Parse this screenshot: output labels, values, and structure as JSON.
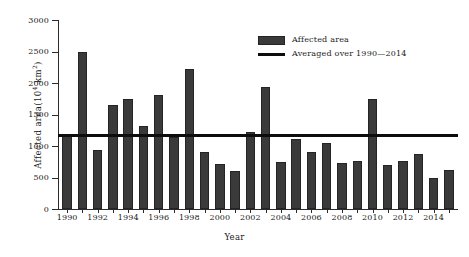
{
  "chart_data": {
    "type": "bar",
    "title": "",
    "xlabel": "Year",
    "ylabel": "Affected area(10⁴ km²)",
    "ylabel_base": "Affected  area(10",
    "ylabel_sup1": "4",
    "ylabel_mid": "  km",
    "ylabel_sup2": "2",
    "ylabel_end": ")",
    "xlim": [
      1989.4,
      2015.6
    ],
    "ylim": [
      0,
      3000
    ],
    "yticks": [
      0,
      500,
      1000,
      1500,
      2000,
      2500,
      3000
    ],
    "ytick_labels": [
      "0",
      "500",
      "1000",
      "1500",
      "2000",
      "2500",
      "3000"
    ],
    "xticks": [
      1990,
      1992,
      1994,
      1996,
      1998,
      2000,
      2002,
      2004,
      2006,
      2008,
      2010,
      2012,
      2014
    ],
    "xtick_labels": [
      "1990",
      "1992",
      "1994",
      "1996",
      "1998",
      "2000",
      "2002",
      "2004",
      "2006",
      "2008",
      "2010",
      "2012",
      "2014"
    ],
    "grid": false,
    "legend_position": "upper-right",
    "bar_color": "#3a3a3a",
    "line_color": "#0d0d0d",
    "categories": [
      1990,
      1991,
      1992,
      1993,
      1994,
      1995,
      1996,
      1997,
      1998,
      1999,
      2000,
      2001,
      2002,
      2003,
      2004,
      2005,
      2006,
      2007,
      2008,
      2009,
      2010,
      2011,
      2012,
      2013,
      2014,
      2015
    ],
    "series": [
      {
        "name": "Affected area",
        "values": [
          1180,
          2490,
          940,
          1650,
          1740,
          1310,
          1810,
          1150,
          2230,
          900,
          720,
          600,
          1230,
          1930,
          740,
          1110,
          900,
          1040,
          730,
          760,
          1750,
          700,
          760,
          870,
          490,
          620
        ]
      }
    ],
    "reference_line": {
      "name": "Averaged over 1990—2014",
      "value": 1180
    },
    "legend": [
      {
        "label": "Affected area",
        "marker": "bar"
      },
      {
        "label": "Averaged over 1990—2014",
        "marker": "line"
      }
    ]
  }
}
